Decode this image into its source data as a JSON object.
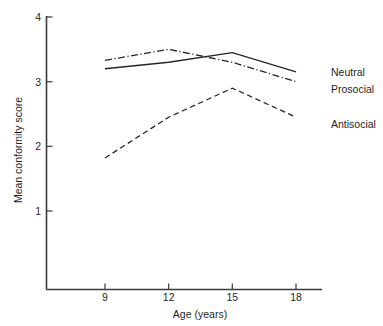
{
  "chart_data": {
    "type": "line",
    "title": "",
    "xlabel": "Age (years)",
    "ylabel": "Mean conformity score",
    "x": [
      9,
      12,
      15,
      18
    ],
    "xticklabels": [
      "9",
      "12",
      "15",
      "18"
    ],
    "yticks": [
      1,
      2,
      3,
      4
    ],
    "yticklabels": [
      "1",
      "2",
      "3",
      "4"
    ],
    "xlim": [
      7.5,
      19.5
    ],
    "ylim": [
      0,
      4
    ],
    "grid": false,
    "legend_position": "right",
    "series": [
      {
        "name": "Neutral",
        "linestyle": "solid",
        "color": "#262626",
        "values": [
          3.2,
          3.3,
          3.45,
          3.15
        ]
      },
      {
        "name": "Prosocial",
        "linestyle": "dashdot",
        "color": "#262626",
        "values": [
          3.33,
          3.5,
          3.3,
          3.0
        ]
      },
      {
        "name": "Antisocial",
        "linestyle": "dashed",
        "color": "#262626",
        "values": [
          1.82,
          2.45,
          2.9,
          2.45
        ]
      }
    ]
  },
  "axes": {
    "y_title": "Mean conformity score",
    "x_title": "Age (years)",
    "y_tick_4": "4",
    "y_tick_3": "3",
    "y_tick_2": "2",
    "y_tick_1": "1",
    "x_tick_9": "9",
    "x_tick_12": "12",
    "x_tick_15": "15",
    "x_tick_18": "18"
  },
  "legend": {
    "items": [
      {
        "label": "Neutral"
      },
      {
        "label": "Prosocial"
      },
      {
        "label": "Antisocial"
      }
    ]
  },
  "colors": {
    "ink": "#262626",
    "axis": "#3a3a3a",
    "background": "#ffffff"
  }
}
